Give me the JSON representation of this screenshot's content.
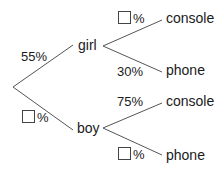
{
  "diagram": {
    "type": "probability-tree",
    "root": {
      "branches": [
        {
          "label": "girl",
          "probability": "55%",
          "branches": [
            {
              "label": "console",
              "probability": "□%",
              "blank": true
            },
            {
              "label": "phone",
              "probability": "30%"
            }
          ]
        },
        {
          "label": "boy",
          "probability": "□%",
          "blank": true,
          "branches": [
            {
              "label": "console",
              "probability": "75%"
            },
            {
              "label": "phone",
              "probability": "□%",
              "blank": true
            }
          ]
        }
      ]
    },
    "labels": {
      "girl": "girl",
      "boy": "boy",
      "girl_console": "console",
      "girl_phone": "phone",
      "boy_console": "console",
      "boy_phone": "phone",
      "p_girl": "55%",
      "p_boy_suffix": "%",
      "p_girl_console_suffix": "%",
      "p_girl_phone": "30%",
      "p_boy_console": "75%",
      "p_boy_phone_suffix": "%"
    },
    "line_color": "#555555"
  }
}
